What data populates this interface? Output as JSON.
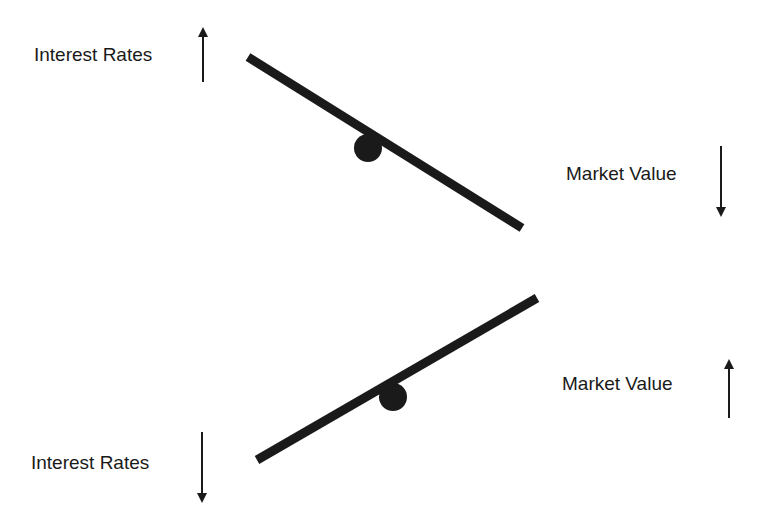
{
  "diagram": {
    "colors": {
      "ink": "#1a1a1a",
      "background": "#ffffff"
    },
    "top_seesaw": {
      "left_label": "Interest Rates",
      "left_arrow": "up",
      "right_label": "Market Value",
      "right_arrow": "down"
    },
    "bottom_seesaw": {
      "left_label": "Interest Rates",
      "left_arrow": "down",
      "right_label": "Market Value",
      "right_arrow": "up"
    }
  }
}
